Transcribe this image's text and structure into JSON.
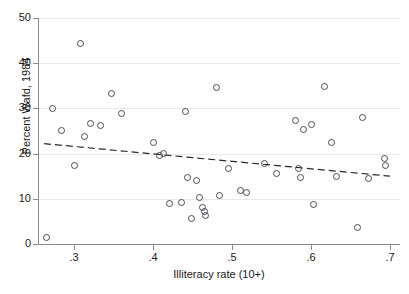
{
  "chart_data": {
    "type": "scatter",
    "title": "",
    "xlabel": "Illiteracy rate (10+)",
    "ylabel": "Percent Wafd, 1984",
    "xlim": [
      0.26,
      0.705
    ],
    "ylim": [
      0,
      50
    ],
    "grid": true,
    "gridlines_y": [
      0,
      10,
      20,
      30,
      40,
      50
    ],
    "xticks": [
      0.3,
      0.4,
      0.5,
      0.6,
      0.7
    ],
    "xtick_labels": [
      ".3",
      ".4",
      ".5",
      ".6",
      ".7"
    ],
    "yticks": [
      0,
      10,
      20,
      30,
      40,
      50
    ],
    "ytick_labels": [
      "0",
      "10",
      "20",
      "30",
      "40",
      "50"
    ],
    "marker": "open-circle",
    "marker_color": "#4a4a56",
    "points": [
      {
        "x": 0.265,
        "y": 1.5
      },
      {
        "x": 0.272,
        "y": 30.0
      },
      {
        "x": 0.283,
        "y": 25.3
      },
      {
        "x": 0.3,
        "y": 17.5
      },
      {
        "x": 0.308,
        "y": 44.5
      },
      {
        "x": 0.313,
        "y": 24.0
      },
      {
        "x": 0.32,
        "y": 26.8
      },
      {
        "x": 0.333,
        "y": 26.3
      },
      {
        "x": 0.347,
        "y": 33.5
      },
      {
        "x": 0.36,
        "y": 29.0
      },
      {
        "x": 0.4,
        "y": 22.5
      },
      {
        "x": 0.408,
        "y": 19.8
      },
      {
        "x": 0.413,
        "y": 20.2
      },
      {
        "x": 0.42,
        "y": 9.0
      },
      {
        "x": 0.435,
        "y": 9.3
      },
      {
        "x": 0.44,
        "y": 29.5
      },
      {
        "x": 0.443,
        "y": 14.8
      },
      {
        "x": 0.448,
        "y": 5.8
      },
      {
        "x": 0.455,
        "y": 14.2
      },
      {
        "x": 0.458,
        "y": 10.3
      },
      {
        "x": 0.462,
        "y": 8.2
      },
      {
        "x": 0.464,
        "y": 7.3
      },
      {
        "x": 0.466,
        "y": 6.4
      },
      {
        "x": 0.48,
        "y": 34.8
      },
      {
        "x": 0.483,
        "y": 10.8
      },
      {
        "x": 0.495,
        "y": 16.8
      },
      {
        "x": 0.51,
        "y": 12.0
      },
      {
        "x": 0.518,
        "y": 11.5
      },
      {
        "x": 0.54,
        "y": 18.0
      },
      {
        "x": 0.556,
        "y": 15.8
      },
      {
        "x": 0.58,
        "y": 27.5
      },
      {
        "x": 0.583,
        "y": 16.8
      },
      {
        "x": 0.586,
        "y": 14.8
      },
      {
        "x": 0.59,
        "y": 25.5
      },
      {
        "x": 0.6,
        "y": 26.5
      },
      {
        "x": 0.603,
        "y": 8.8
      },
      {
        "x": 0.617,
        "y": 35.0
      },
      {
        "x": 0.625,
        "y": 22.5
      },
      {
        "x": 0.632,
        "y": 15.0
      },
      {
        "x": 0.658,
        "y": 3.8
      },
      {
        "x": 0.665,
        "y": 28.0
      },
      {
        "x": 0.672,
        "y": 14.5
      },
      {
        "x": 0.692,
        "y": 19.0
      },
      {
        "x": 0.694,
        "y": 17.5
      }
    ],
    "fit_line": {
      "style": "dashed",
      "color": "#2a2a2a",
      "x_start": 0.262,
      "y_start": 22.2,
      "x_end": 0.7,
      "y_end": 15.0
    }
  }
}
